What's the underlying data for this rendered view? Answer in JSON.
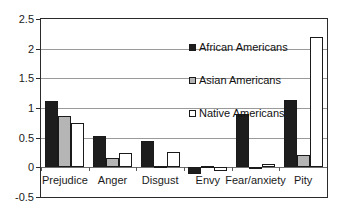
{
  "chart_data": {
    "type": "bar",
    "title": "",
    "xlabel": "",
    "ylabel": "",
    "ylim": [
      -0.5,
      2.5
    ],
    "yticks": [
      "2.5",
      "2",
      "1.5",
      "1",
      "0.5",
      "0",
      "-0.5"
    ],
    "ytick_values": [
      2.5,
      2,
      1.5,
      1,
      0.5,
      0,
      -0.5
    ],
    "grid": true,
    "legend_position": "inside-upper-right",
    "categories": [
      "Prejudice",
      "Anger",
      "Disgust",
      "Envy",
      "Fear/anxiety",
      "Pity"
    ],
    "series": [
      {
        "name": "African Americans",
        "color": "#1d1d1d",
        "values": [
          1.12,
          0.52,
          0.44,
          -0.11,
          0.9,
          1.14
        ]
      },
      {
        "name": "Asian Americans",
        "color": "#b5b5b5",
        "values": [
          0.87,
          0.16,
          0.02,
          0.0,
          -0.03,
          0.2
        ]
      },
      {
        "name": "Native Americans",
        "color": "#ffffff",
        "values": [
          0.74,
          0.24,
          0.26,
          -0.07,
          0.05,
          2.19
        ]
      }
    ]
  },
  "legend": {
    "items": [
      {
        "label": "African Americans"
      },
      {
        "label": "Asian Americans"
      },
      {
        "label": "Native Americans"
      }
    ]
  }
}
